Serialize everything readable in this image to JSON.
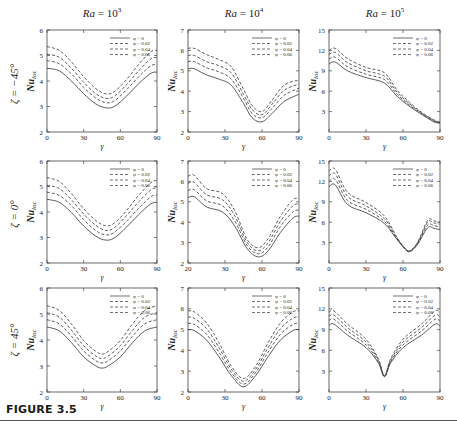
{
  "figure": {
    "caption": "FIGURE 3.5",
    "column_titles": [
      {
        "prefix": "Ra",
        "text": " = 10",
        "exp": "3"
      },
      {
        "prefix": "Ra",
        "text": " = 10",
        "exp": "4"
      },
      {
        "prefix": "Ra",
        "text": " = 10",
        "exp": "5"
      }
    ],
    "row_labels": [
      "ζ = −45°",
      "ζ = 0°",
      "ζ = 45°"
    ],
    "ylabel": "Nu",
    "ylabel_sub": "loc",
    "xlabel": "γ",
    "legend": [
      "φ = 0",
      "φ = 0.02",
      "φ = 0.04",
      "φ = 0.06"
    ],
    "colors": {
      "line": "#333333",
      "axis": "#444444",
      "text": "#222222"
    }
  },
  "chart_data": [
    {
      "type": "line",
      "panel": "row1-col1",
      "title": "Ra = 10^3",
      "row_label": "ζ = −45°",
      "xlabel": "γ",
      "ylabel": "Nu_loc",
      "xlim": [
        0,
        90
      ],
      "ylim": [
        2,
        6
      ],
      "xticks": [
        0,
        30,
        60,
        90
      ],
      "yticks": [
        2,
        3,
        4,
        5,
        6
      ],
      "legend_position": "upper right",
      "x": [
        0,
        10,
        20,
        30,
        40,
        48,
        55,
        65,
        75,
        85,
        90
      ],
      "series": [
        {
          "name": "φ = 0",
          "style": "solid",
          "values": [
            4.5,
            4.4,
            4.0,
            3.5,
            3.1,
            2.95,
            3.0,
            3.4,
            3.9,
            4.3,
            4.35
          ]
        },
        {
          "name": "φ = 0.02",
          "style": "dashed",
          "values": [
            4.8,
            4.68,
            4.28,
            3.75,
            3.33,
            3.15,
            3.22,
            3.65,
            4.17,
            4.6,
            4.65
          ]
        },
        {
          "name": "φ = 0.04",
          "style": "dashed",
          "values": [
            5.05,
            4.93,
            4.5,
            3.95,
            3.5,
            3.32,
            3.4,
            3.85,
            4.4,
            4.87,
            4.92
          ]
        },
        {
          "name": "φ = 0.06",
          "style": "dashed",
          "values": [
            5.35,
            5.2,
            4.75,
            4.17,
            3.7,
            3.5,
            3.58,
            4.05,
            4.65,
            5.15,
            5.2
          ]
        }
      ]
    },
    {
      "type": "line",
      "panel": "row1-col2",
      "title": "Ra = 10^4",
      "row_label": "ζ = −45°",
      "xlabel": "γ",
      "ylabel": "Nu_loc",
      "xlim": [
        0,
        90
      ],
      "ylim": [
        2,
        7
      ],
      "xticks": [
        0,
        30,
        60,
        90
      ],
      "yticks": [
        2,
        3,
        4,
        5,
        6,
        7
      ],
      "legend_position": "upper right",
      "x": [
        0,
        5,
        15,
        25,
        35,
        45,
        52,
        60,
        68,
        78,
        90
      ],
      "series": [
        {
          "name": "φ = 0",
          "style": "solid",
          "values": [
            5.1,
            5.1,
            4.8,
            4.6,
            4.3,
            3.4,
            2.7,
            2.5,
            2.9,
            3.5,
            3.85
          ]
        },
        {
          "name": "φ = 0.02",
          "style": "dashed",
          "values": [
            5.45,
            5.45,
            5.15,
            4.95,
            4.6,
            3.65,
            2.9,
            2.7,
            3.15,
            3.8,
            4.15
          ]
        },
        {
          "name": "φ = 0.04",
          "style": "dashed",
          "values": [
            5.75,
            5.75,
            5.45,
            5.25,
            4.9,
            3.85,
            3.1,
            2.85,
            3.35,
            4.05,
            4.35
          ]
        },
        {
          "name": "φ = 0.06",
          "style": "dashed",
          "values": [
            6.1,
            6.1,
            5.8,
            5.55,
            5.2,
            4.1,
            3.3,
            3.0,
            3.55,
            4.3,
            4.55
          ]
        }
      ]
    },
    {
      "type": "line",
      "panel": "row1-col3",
      "title": "Ra = 10^5",
      "row_label": "ζ = −45°",
      "xlabel": "γ",
      "ylabel": "Nu_loc",
      "xlim": [
        0,
        90
      ],
      "ylim": [
        0,
        15
      ],
      "xticks": [
        0,
        30,
        60,
        90
      ],
      "yticks": [
        3,
        6,
        9,
        12,
        15
      ],
      "legend_position": "upper right",
      "x": [
        0,
        5,
        15,
        30,
        45,
        55,
        65,
        75,
        85,
        90
      ],
      "series": [
        {
          "name": "φ = 0",
          "style": "solid",
          "values": [
            10.0,
            10.3,
            9.0,
            8.0,
            7.2,
            5.3,
            3.8,
            2.6,
            1.5,
            1.3
          ]
        },
        {
          "name": "φ = 0.02",
          "style": "dashed",
          "values": [
            10.7,
            11.0,
            9.6,
            8.5,
            7.7,
            5.6,
            4.0,
            2.7,
            1.6,
            1.35
          ]
        },
        {
          "name": "φ = 0.04",
          "style": "dashed",
          "values": [
            11.4,
            11.7,
            10.2,
            9.0,
            8.2,
            5.9,
            4.2,
            2.8,
            1.7,
            1.4
          ]
        },
        {
          "name": "φ = 0.06",
          "style": "dashed",
          "values": [
            12.0,
            12.3,
            10.8,
            9.5,
            8.7,
            6.2,
            4.4,
            2.9,
            1.8,
            1.45
          ]
        }
      ]
    },
    {
      "type": "line",
      "panel": "row2-col1",
      "title": "",
      "row_label": "ζ = 0°",
      "xlabel": "γ",
      "ylabel": "Nu_loc",
      "xlim": [
        0,
        90
      ],
      "ylim": [
        2,
        6
      ],
      "xticks": [
        0,
        30,
        60,
        90
      ],
      "yticks": [
        2,
        3,
        4,
        5,
        6
      ],
      "legend_position": "upper right",
      "x": [
        0,
        10,
        20,
        30,
        40,
        48,
        55,
        65,
        75,
        85,
        90
      ],
      "series": [
        {
          "name": "φ = 0",
          "style": "solid",
          "values": [
            4.5,
            4.38,
            3.98,
            3.45,
            3.05,
            2.9,
            2.98,
            3.4,
            3.9,
            4.32,
            4.38
          ]
        },
        {
          "name": "φ = 0.02",
          "style": "dashed",
          "values": [
            4.78,
            4.65,
            4.25,
            3.7,
            3.27,
            3.1,
            3.2,
            3.63,
            4.15,
            4.6,
            4.67
          ]
        },
        {
          "name": "φ = 0.04",
          "style": "dashed",
          "values": [
            5.05,
            4.92,
            4.48,
            3.92,
            3.47,
            3.28,
            3.38,
            3.85,
            4.4,
            4.87,
            4.95
          ]
        },
        {
          "name": "φ = 0.06",
          "style": "dashed",
          "values": [
            5.35,
            5.2,
            4.72,
            4.13,
            3.66,
            3.46,
            3.56,
            4.05,
            4.65,
            5.15,
            5.25
          ]
        }
      ]
    },
    {
      "type": "line",
      "panel": "row2-col2",
      "title": "",
      "row_label": "ζ = 0°",
      "xlabel": "γ",
      "ylabel": "Nu_loc",
      "xlim": [
        20,
        90
      ],
      "ylim": [
        2,
        7
      ],
      "xticks": [
        20,
        30,
        60,
        90
      ],
      "xtick_positions": [
        0,
        30,
        60,
        90
      ],
      "yticks": [
        2,
        3,
        4,
        5,
        6,
        7
      ],
      "legend_position": "upper right",
      "x": [
        0,
        5,
        15,
        28,
        38,
        48,
        57,
        65,
        75,
        85,
        90
      ],
      "series": [
        {
          "name": "φ = 0",
          "style": "solid",
          "values": [
            5.2,
            5.25,
            4.75,
            4.5,
            3.8,
            2.7,
            2.3,
            2.6,
            3.5,
            4.2,
            4.3
          ]
        },
        {
          "name": "φ = 0.02",
          "style": "dashed",
          "values": [
            5.55,
            5.6,
            5.05,
            4.8,
            4.05,
            2.85,
            2.45,
            2.8,
            3.8,
            4.5,
            4.6
          ]
        },
        {
          "name": "φ = 0.04",
          "style": "dashed",
          "values": [
            5.9,
            5.95,
            5.35,
            5.1,
            4.3,
            3.0,
            2.6,
            3.0,
            4.05,
            4.8,
            4.9
          ]
        },
        {
          "name": "φ = 0.06",
          "style": "dashed",
          "values": [
            6.25,
            6.3,
            5.65,
            5.4,
            4.55,
            3.15,
            2.75,
            3.2,
            4.3,
            5.1,
            5.15
          ]
        }
      ]
    },
    {
      "type": "line",
      "panel": "row2-col3",
      "title": "",
      "row_label": "ζ = 0°",
      "xlabel": "γ",
      "ylabel": "Nu_loc",
      "xlim": [
        0,
        90
      ],
      "ylim": [
        0,
        15
      ],
      "xticks": [
        0,
        30,
        60,
        90
      ],
      "yticks": [
        3,
        6,
        9,
        12,
        15
      ],
      "legend_position": "upper right",
      "x": [
        0,
        5,
        15,
        30,
        45,
        55,
        62,
        66,
        72,
        80,
        85,
        90
      ],
      "series": [
        {
          "name": "φ = 0",
          "style": "solid",
          "values": [
            11.2,
            11.5,
            8.6,
            7.4,
            5.8,
            3.5,
            2.0,
            1.7,
            2.8,
            5.2,
            5.1,
            4.9
          ]
        },
        {
          "name": "φ = 0.02",
          "style": "dashed",
          "values": [
            12.0,
            12.3,
            9.2,
            7.9,
            6.1,
            3.6,
            2.0,
            1.75,
            2.9,
            5.6,
            5.5,
            5.3
          ]
        },
        {
          "name": "φ = 0.04",
          "style": "dashed",
          "values": [
            12.8,
            13.1,
            9.8,
            8.4,
            6.5,
            3.7,
            2.05,
            1.8,
            3.0,
            6.0,
            5.9,
            5.7
          ]
        },
        {
          "name": "φ = 0.06",
          "style": "dashed",
          "values": [
            13.5,
            13.8,
            10.4,
            8.9,
            6.9,
            3.8,
            2.1,
            1.85,
            3.1,
            6.3,
            6.2,
            6.0
          ]
        }
      ]
    },
    {
      "type": "line",
      "panel": "row3-col1",
      "title": "",
      "row_label": "ζ = 45°",
      "xlabel": "γ",
      "ylabel": "Nu_loc",
      "xlim": [
        0,
        90
      ],
      "ylim": [
        2,
        6
      ],
      "xticks": [
        0,
        30,
        60,
        90
      ],
      "yticks": [
        2,
        3,
        4,
        5,
        6
      ],
      "legend_position": "upper right",
      "x": [
        0,
        10,
        20,
        30,
        40,
        45,
        50,
        60,
        70,
        80,
        90
      ],
      "series": [
        {
          "name": "φ = 0",
          "style": "solid",
          "values": [
            4.5,
            4.35,
            3.9,
            3.35,
            3.0,
            2.92,
            3.0,
            3.35,
            3.9,
            4.35,
            4.5
          ]
        },
        {
          "name": "φ = 0.02",
          "style": "dashed",
          "values": [
            4.78,
            4.62,
            4.15,
            3.58,
            3.2,
            3.12,
            3.2,
            3.58,
            4.15,
            4.62,
            4.78
          ]
        },
        {
          "name": "φ = 0.04",
          "style": "dashed",
          "values": [
            5.05,
            4.88,
            4.38,
            3.78,
            3.38,
            3.29,
            3.38,
            3.78,
            4.38,
            4.88,
            5.05
          ]
        },
        {
          "name": "φ = 0.06",
          "style": "dashed",
          "values": [
            5.32,
            5.14,
            4.62,
            3.98,
            3.56,
            3.46,
            3.56,
            3.98,
            4.62,
            5.14,
            5.32
          ]
        }
      ]
    },
    {
      "type": "line",
      "panel": "row3-col2",
      "title": "",
      "row_label": "ζ = 45°",
      "xlabel": "γ",
      "ylabel": "Nu_loc",
      "xlim": [
        0,
        90
      ],
      "ylim": [
        2,
        7
      ],
      "xticks": [
        0,
        30,
        60,
        90
      ],
      "yticks": [
        2,
        3,
        4,
        5,
        6,
        7
      ],
      "legend_position": "upper right",
      "x": [
        0,
        5,
        15,
        25,
        35,
        45,
        55,
        65,
        75,
        85,
        90
      ],
      "series": [
        {
          "name": "φ = 0",
          "style": "solid",
          "values": [
            5.0,
            4.95,
            4.5,
            3.7,
            2.8,
            2.25,
            2.8,
            3.7,
            4.5,
            4.95,
            5.0
          ]
        },
        {
          "name": "φ = 0.02",
          "style": "dashed",
          "values": [
            5.3,
            5.25,
            4.78,
            3.92,
            2.95,
            2.38,
            2.95,
            3.92,
            4.78,
            5.25,
            5.3
          ]
        },
        {
          "name": "φ = 0.04",
          "style": "dashed",
          "values": [
            5.6,
            5.55,
            5.05,
            4.15,
            3.1,
            2.52,
            3.1,
            4.15,
            5.05,
            5.55,
            5.6
          ]
        },
        {
          "name": "φ = 0.06",
          "style": "dashed",
          "values": [
            5.9,
            5.85,
            5.32,
            4.38,
            3.25,
            2.65,
            3.25,
            4.38,
            5.32,
            5.85,
            5.9
          ]
        }
      ]
    },
    {
      "type": "line",
      "panel": "row3-col3",
      "title": "",
      "row_label": "ζ = 45°",
      "xlabel": "γ",
      "ylabel": "Nu_loc",
      "xlim": [
        0,
        90
      ],
      "ylim": [
        0,
        15
      ],
      "xticks": [
        0,
        30,
        60,
        90
      ],
      "yticks": [
        3,
        6,
        9,
        12,
        15
      ],
      "legend_position": "upper right",
      "x": [
        0,
        4,
        15,
        30,
        40,
        45,
        50,
        60,
        75,
        86,
        90
      ],
      "series": [
        {
          "name": "φ = 0",
          "style": "solid",
          "values": [
            9.6,
            9.8,
            8.2,
            6.4,
            4.2,
            2.2,
            4.2,
            6.4,
            8.2,
            9.8,
            9.5
          ]
        },
        {
          "name": "φ = 0.02",
          "style": "dashed",
          "values": [
            10.3,
            10.5,
            8.8,
            6.8,
            4.4,
            2.25,
            4.4,
            6.8,
            8.8,
            10.5,
            10.2
          ]
        },
        {
          "name": "φ = 0.04",
          "style": "dashed",
          "values": [
            10.9,
            11.1,
            9.3,
            7.2,
            4.6,
            2.3,
            4.6,
            7.2,
            9.3,
            11.1,
            10.8
          ]
        },
        {
          "name": "φ = 0.06",
          "style": "dashed",
          "values": [
            11.5,
            11.7,
            9.8,
            7.6,
            4.8,
            2.35,
            4.8,
            7.6,
            9.8,
            11.7,
            11.4
          ]
        }
      ]
    }
  ]
}
